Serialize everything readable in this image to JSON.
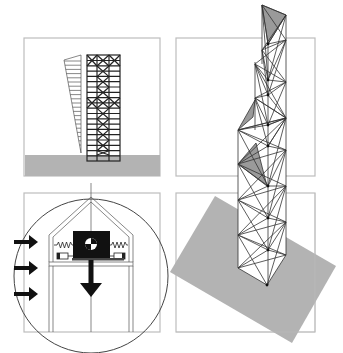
{
  "figure": {
    "panels": [
      {
        "id": "elevation",
        "description": "Braced frame elevation with lateral load profile"
      },
      {
        "id": "damper",
        "description": "Tuned mass damper detail with wind load arrows"
      },
      {
        "id": "tower-top",
        "description": "Axonometric twisted truss tower, upper section"
      },
      {
        "id": "tower-base",
        "description": "Axonometric twisted truss tower on ground plane"
      }
    ],
    "colors": {
      "frame": "#bdbdbd",
      "ground": "#b3b3b3",
      "shade": "#9a9a9a",
      "line": "#222222",
      "mass": "#111111"
    }
  }
}
